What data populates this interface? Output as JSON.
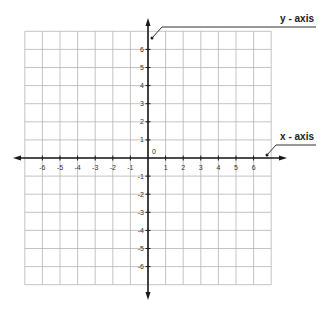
{
  "diagram": {
    "type": "coordinate-plane",
    "x_range": [
      -7,
      7
    ],
    "y_range": [
      -7,
      7
    ],
    "grid": true,
    "origin_label": "0",
    "x_tick_labels": [
      "-6",
      "-5",
      "-4",
      "-3",
      "-2",
      "-1",
      "1",
      "2",
      "3",
      "4",
      "5",
      "6"
    ],
    "y_tick_labels": [
      "6",
      "5",
      "4",
      "3",
      "2",
      "1",
      "-1",
      "-2",
      "-3",
      "-4",
      "-5",
      "-6"
    ],
    "callouts": {
      "y_axis_label": "y - axis",
      "x_axis_label": "x - axis"
    }
  },
  "colors": {
    "grid": "#b5b5b5",
    "axis": "#1a1a1a",
    "text": "#333333",
    "background": "#ffffff"
  }
}
